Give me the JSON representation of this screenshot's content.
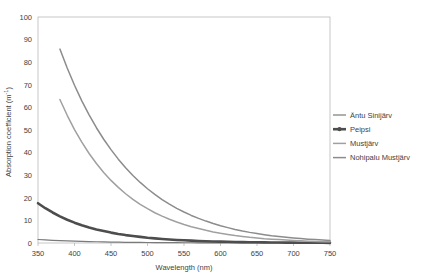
{
  "chart_data": {
    "type": "line",
    "title": "",
    "xlabel": "Wavelength (nm)",
    "ylabel": "Absorption coefficient (m-1)",
    "ylabel_display": "Absorption coefficient (m",
    "ylabel_exponent": "-1",
    "ylabel_close": ")",
    "xlim": [
      350,
      750
    ],
    "ylim": [
      0,
      100
    ],
    "xticks": [
      350,
      400,
      450,
      500,
      550,
      600,
      650,
      700,
      750
    ],
    "yticks": [
      0,
      10,
      20,
      30,
      40,
      50,
      60,
      70,
      80,
      90,
      100
    ],
    "grid": false,
    "legend_position": "right",
    "series": [
      {
        "name": "Äntu Sinijärv",
        "color": "#7a7a7a",
        "width": 1.2,
        "marker": "none",
        "x": [
          350,
          360,
          370,
          380,
          390,
          400,
          410,
          420,
          430,
          440,
          450,
          460,
          470,
          480,
          490,
          500,
          510,
          520,
          530,
          540,
          550,
          560,
          570,
          580,
          590,
          600,
          610,
          620,
          630,
          640,
          650,
          660,
          670,
          680,
          690,
          700,
          710,
          720,
          730,
          740,
          750
        ],
        "y": [
          1.55,
          1.36,
          1.19,
          1.05,
          0.92,
          0.81,
          0.71,
          0.62,
          0.55,
          0.48,
          0.42,
          0.37,
          0.32,
          0.28,
          0.25,
          0.22,
          0.19,
          0.17,
          0.15,
          0.13,
          0.12,
          0.1,
          0.09,
          0.08,
          0.07,
          0.06,
          0.05,
          0.05,
          0.04,
          0.04,
          0.03,
          0.03,
          0.02,
          0.02,
          0.02,
          0.02,
          0.01,
          0.01,
          0.01,
          0.01,
          0.01
        ]
      },
      {
        "name": "Peipsi",
        "color": "#4d4d4d",
        "width": 2.6,
        "marker": "line-dot",
        "x": [
          350,
          360,
          370,
          380,
          390,
          400,
          410,
          420,
          430,
          440,
          450,
          460,
          470,
          480,
          490,
          500,
          510,
          520,
          530,
          540,
          550,
          560,
          570,
          580,
          590,
          600,
          610,
          620,
          630,
          640,
          650,
          660,
          670,
          680,
          690,
          700,
          710,
          720,
          730,
          740,
          750
        ],
        "y": [
          17.6,
          15.4,
          13.5,
          11.8,
          10.3,
          9.0,
          7.9,
          6.9,
          6.0,
          5.3,
          4.6,
          4.0,
          3.5,
          3.1,
          2.7,
          2.3,
          2.05,
          1.8,
          1.55,
          1.35,
          1.2,
          1.03,
          0.9,
          0.78,
          0.68,
          0.6,
          0.52,
          0.45,
          0.39,
          0.34,
          0.3,
          0.26,
          0.22,
          0.19,
          0.17,
          0.15,
          0.13,
          0.11,
          0.1,
          0.08,
          0.07
        ]
      },
      {
        "name": "Mustjärv",
        "color": "#a0a0a0",
        "width": 1.5,
        "marker": "none",
        "x": [
          380,
          390,
          400,
          410,
          420,
          430,
          440,
          450,
          460,
          470,
          480,
          490,
          500,
          510,
          520,
          530,
          540,
          550,
          560,
          570,
          580,
          590,
          600,
          610,
          620,
          630,
          640,
          650,
          660,
          670,
          680,
          690,
          700,
          710,
          720,
          730,
          740,
          750
        ],
        "y": [
          63.5,
          56.5,
          50.2,
          44.6,
          39.6,
          35.2,
          31.2,
          27.7,
          24.6,
          21.8,
          19.3,
          17.1,
          15.2,
          13.4,
          11.9,
          10.5,
          9.3,
          8.2,
          7.2,
          6.4,
          5.6,
          4.9,
          4.3,
          3.8,
          3.3,
          2.9,
          2.5,
          2.2,
          1.9,
          1.7,
          1.5,
          1.3,
          1.1,
          0.95,
          0.82,
          0.7,
          0.6,
          0.5
        ]
      },
      {
        "name": "Nohipalu Mustjärv",
        "color": "#8c8c8c",
        "width": 1.5,
        "marker": "none",
        "x": [
          380,
          390,
          400,
          410,
          420,
          430,
          440,
          450,
          460,
          470,
          480,
          490,
          500,
          510,
          520,
          530,
          540,
          550,
          560,
          570,
          580,
          590,
          600,
          610,
          620,
          630,
          640,
          650,
          660,
          670,
          680,
          690,
          700,
          710,
          720,
          730,
          740,
          750
        ],
        "y": [
          85.8,
          77.4,
          69.8,
          62.9,
          56.7,
          51.0,
          45.9,
          41.3,
          37.1,
          33.3,
          29.9,
          26.8,
          24.0,
          21.5,
          19.2,
          17.2,
          15.3,
          13.7,
          12.2,
          10.9,
          9.7,
          8.6,
          7.6,
          6.8,
          6.0,
          5.3,
          4.7,
          4.2,
          3.7,
          3.2,
          2.85,
          2.5,
          2.2,
          1.95,
          1.7,
          1.5,
          1.3,
          1.15
        ]
      }
    ]
  },
  "legend": {
    "entries": [
      {
        "label": "Äntu Sinijärv"
      },
      {
        "label": "Peipsi"
      },
      {
        "label": "Mustjärv"
      },
      {
        "label": "Nohipalu Mustjärv"
      }
    ]
  }
}
